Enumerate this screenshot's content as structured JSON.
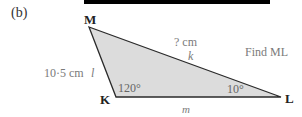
{
  "part_label": "(b)",
  "instruction": "Find ML",
  "vertices": {
    "M": "M",
    "K": "K",
    "L": "L"
  },
  "sides": {
    "ML": {
      "name": "k",
      "length": "? cm"
    },
    "MK": {
      "name": "l",
      "length": "10·5 cm"
    },
    "KL": {
      "name": "m"
    }
  },
  "angles": {
    "K": "120°",
    "L": "10°"
  },
  "colors": {
    "fill": "#d9d9d9",
    "stroke": "#2a2a2a",
    "label_gray": "#7a7a7a",
    "bar": "#000000"
  }
}
